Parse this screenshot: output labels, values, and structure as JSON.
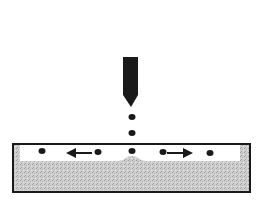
{
  "diagram": {
    "colors": {
      "background": "#ffffff",
      "ink": "#1a1a1a",
      "substrate": "#c8c8c8",
      "liquid_layer": "#ffffff"
    },
    "nozzle": {
      "x": 123,
      "y": 57,
      "width": 15,
      "height": 38,
      "tip_y": 106
    },
    "falling_droplets": [
      {
        "cx": 132,
        "cy": 117
      },
      {
        "cx": 132,
        "cy": 133
      }
    ],
    "impact_droplet": {
      "cx": 132,
      "cy": 151
    },
    "surface_droplets": [
      {
        "cx": 42,
        "cy": 151
      },
      {
        "cx": 98,
        "cy": 152
      },
      {
        "cx": 163,
        "cy": 152
      },
      {
        "cx": 210,
        "cy": 153
      }
    ],
    "arrows": [
      {
        "direction": "left",
        "x1": 92,
        "x2": 66,
        "y": 153
      },
      {
        "direction": "right",
        "x1": 170,
        "x2": 193,
        "y": 153
      }
    ],
    "container": {
      "x": 13,
      "y": 144,
      "width": 237,
      "height": 48
    }
  }
}
